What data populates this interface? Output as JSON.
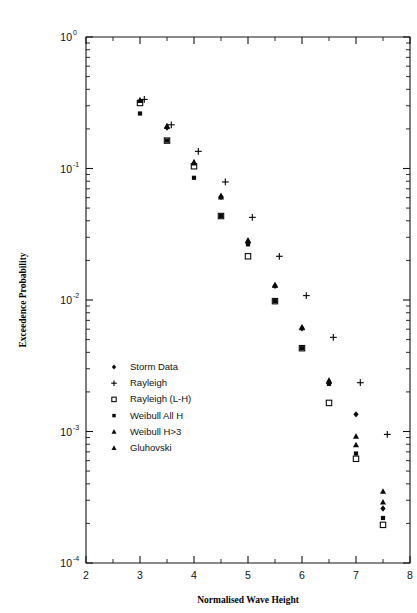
{
  "figure": {
    "background": "#ffffff",
    "frame_color": "#141414"
  },
  "chart_data": {
    "type": "scatter",
    "title": "",
    "xlabel": "Normalised Wave Height",
    "ylabel": "Exceedence Probability",
    "xscale": "linear",
    "yscale": "log",
    "xlim": [
      2,
      8
    ],
    "ylim": [
      0.0001,
      1
    ],
    "grid": false,
    "legend_position": "lower-left-inside",
    "xticks": [
      2,
      3,
      4,
      5,
      6,
      7,
      8
    ],
    "xticklabels": [
      "2",
      "3",
      "4",
      "5",
      "6",
      "7",
      "8"
    ],
    "xminor_ticks": [
      2.5,
      3.5,
      4.5,
      5.5,
      6.5,
      7.5
    ],
    "yticks": [
      1,
      0.1,
      0.01,
      0.001,
      0.0001
    ],
    "yticklabels": [
      "10 0",
      "10 -1",
      "10 -2",
      "10 -3",
      "10 -4"
    ],
    "ytick_mantissa": [
      "10",
      "10",
      "10",
      "10",
      "10"
    ],
    "ytick_exponent": [
      "0",
      "-1",
      "-2",
      "-3",
      "-4"
    ],
    "series": [
      {
        "name": "Storm Data",
        "marker": "diamond",
        "color": "#0b0b0b",
        "x": [
          3.0,
          3.5,
          4.0,
          4.5,
          5.0,
          5.5,
          6.0,
          6.5,
          7.0,
          7.5
        ],
        "y": [
          0.325,
          0.205,
          0.108,
          0.061,
          0.0275,
          0.0128,
          0.0061,
          0.00235,
          0.00135,
          0.00026
        ]
      },
      {
        "name": "Rayleigh",
        "marker": "plus",
        "color": "#0b0b0b",
        "x": [
          3.08,
          3.58,
          4.08,
          4.58,
          5.08,
          5.58,
          6.08,
          6.58,
          7.08,
          7.58
        ],
        "y": [
          0.335,
          0.215,
          0.135,
          0.079,
          0.0425,
          0.0215,
          0.0108,
          0.0052,
          0.00235,
          0.00095
        ]
      },
      {
        "name": "Rayleigh (L-H)",
        "marker": "square-open",
        "color": "#0b0b0b",
        "x": [
          3.0,
          3.5,
          4.0,
          4.5,
          5.0,
          5.5,
          6.0,
          6.5,
          7.0,
          7.5
        ],
        "y": [
          0.315,
          0.163,
          0.104,
          0.0435,
          0.0215,
          0.0098,
          0.0043,
          0.00165,
          0.00062,
          0.000195
        ]
      },
      {
        "name": "Weibull All H",
        "marker": "square-small",
        "color": "#0b0b0b",
        "x": [
          3.0,
          3.5,
          4.0,
          4.5,
          5.0,
          5.5,
          6.0,
          6.5,
          7.0,
          7.5
        ],
        "y": [
          0.262,
          0.163,
          0.085,
          0.0435,
          0.0265,
          0.0098,
          0.0043,
          0.0023,
          0.00068,
          0.00022
        ]
      },
      {
        "name": "Weibull H>3",
        "marker": "triangle",
        "color": "#0b0b0b",
        "x": [
          3.0,
          3.5,
          4.0,
          4.5,
          5.0,
          5.5,
          6.0,
          6.5,
          7.0,
          7.5
        ],
        "y": [
          0.33,
          0.21,
          0.112,
          0.062,
          0.0285,
          0.013,
          0.0062,
          0.00245,
          0.00092,
          0.00035
        ]
      },
      {
        "name": "Gluhovski",
        "marker": "triangle",
        "color": "#0b0b0b",
        "x": [
          3.0,
          3.5,
          4.0,
          4.5,
          5.0,
          5.5,
          6.0,
          6.5,
          7.0,
          7.5
        ],
        "y": [
          0.328,
          0.208,
          0.11,
          0.0605,
          0.028,
          0.0129,
          0.00615,
          0.0024,
          0.00079,
          0.00029
        ]
      }
    ],
    "legend_entries": [
      {
        "label": "Storm Data",
        "marker": "diamond"
      },
      {
        "label": "Rayleigh",
        "marker": "plus"
      },
      {
        "label": "Rayleigh (L-H)",
        "marker": "square-open"
      },
      {
        "label": "Weibull All H",
        "marker": "square-small"
      },
      {
        "label": "Weibull H>3",
        "marker": "triangle"
      },
      {
        "label": "Gluhovski",
        "marker": "triangle"
      }
    ]
  }
}
